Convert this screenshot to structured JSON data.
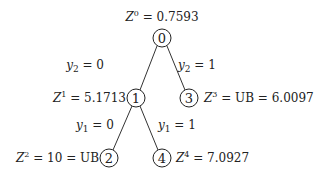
{
  "diagram": {
    "type": "branch-and-bound-tree",
    "nodes": [
      {
        "id": "0",
        "label": "0",
        "annotation": {
          "var": "Z",
          "sup": "0",
          "rest": " = 0.7593"
        }
      },
      {
        "id": "1",
        "label": "1",
        "annotation": {
          "var": "Z",
          "sup": "1",
          "rest": " = 5.1713"
        }
      },
      {
        "id": "3",
        "label": "3",
        "annotation": {
          "var": "Z",
          "sup": "3",
          "rest": " = UB = 6.0097"
        }
      },
      {
        "id": "2",
        "label": "2",
        "annotation": {
          "var": "Z",
          "sup": "2",
          "rest": " = 10 = UB"
        }
      },
      {
        "id": "4",
        "label": "4",
        "annotation": {
          "var": "Z",
          "sup": "4",
          "rest": " = 7.0927"
        }
      }
    ],
    "edges": [
      {
        "from": "0",
        "to": "1",
        "label": {
          "var": "y",
          "sub": "2",
          "rest": " = 0"
        }
      },
      {
        "from": "0",
        "to": "3",
        "label": {
          "var": "y",
          "sub": "2",
          "rest": " = 1"
        }
      },
      {
        "from": "1",
        "to": "2",
        "label": {
          "var": "y",
          "sub": "1",
          "rest": " = 0"
        }
      },
      {
        "from": "1",
        "to": "4",
        "label": {
          "var": "y",
          "sub": "1",
          "rest": " = 1"
        }
      }
    ]
  }
}
